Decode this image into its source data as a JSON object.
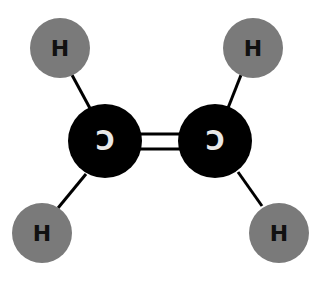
{
  "diagram": {
    "title": "",
    "molecule": "ethylene",
    "colors": {
      "hydrogen": "#7a7a7a",
      "carbon": "#000000",
      "bond": "#000000",
      "carbon_label": "#e8e8e8",
      "hydrogen_label": "#111111"
    },
    "atoms": [
      {
        "id": "H1",
        "element": "H",
        "label": "H",
        "cx": 60,
        "cy": 48,
        "r": 30
      },
      {
        "id": "H2",
        "element": "H",
        "label": "H",
        "cx": 253,
        "cy": 48,
        "r": 30
      },
      {
        "id": "C1",
        "element": "C",
        "label": "C",
        "cx": 105,
        "cy": 141,
        "r": 37
      },
      {
        "id": "C2",
        "element": "C",
        "label": "C",
        "cx": 215,
        "cy": 141,
        "r": 37
      },
      {
        "id": "H3",
        "element": "H",
        "label": "H",
        "cx": 42,
        "cy": 233,
        "r": 30
      },
      {
        "id": "H4",
        "element": "H",
        "label": "H",
        "cx": 279,
        "cy": 233,
        "r": 30
      }
    ],
    "bonds": [
      {
        "from": "H1",
        "to": "C1",
        "order": 1
      },
      {
        "from": "H2",
        "to": "C2",
        "order": 1
      },
      {
        "from": "C1",
        "to": "C2",
        "order": 2
      },
      {
        "from": "C1",
        "to": "H3",
        "order": 1
      },
      {
        "from": "C2",
        "to": "H4",
        "order": 1
      }
    ]
  }
}
